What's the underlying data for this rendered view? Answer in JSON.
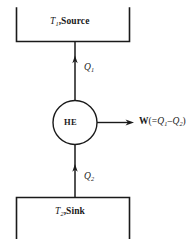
{
  "diagram": {
    "type": "heat-engine-schematic",
    "title": "",
    "colors": {
      "stroke": "#1a1a1a",
      "background": "#ffffff",
      "text": "#1a1a1a"
    },
    "source_reservoir": {
      "name": "source-reservoir",
      "temperature_symbol": "T",
      "temperature_subscript": "1",
      "separator": ",",
      "label": "Source",
      "full_label": "T1,Source",
      "shape": "open-top-rectangle"
    },
    "sink_reservoir": {
      "name": "sink-reservoir",
      "temperature_symbol": "T",
      "temperature_subscript": "2",
      "separator": ",",
      "label": "Sink",
      "full_label": "T2,Sink",
      "shape": "open-bottom-rectangle"
    },
    "engine": {
      "name": "heat-engine",
      "label": "HE",
      "shape": "circle"
    },
    "heat_input": {
      "name": "heat-input-q1",
      "symbol": "Q",
      "subscript": "1",
      "full_label": "Q1",
      "direction": "up",
      "from": "source-reservoir",
      "to": "heat-engine"
    },
    "heat_output": {
      "name": "heat-output-q2",
      "symbol": "Q",
      "subscript": "2",
      "full_label": "Q2",
      "direction": "up",
      "from": "sink-reservoir",
      "to": "heat-engine"
    },
    "work_output": {
      "name": "work-output",
      "symbol": "W",
      "open_paren": "(=",
      "term1_symbol": "Q",
      "term1_subscript": "1",
      "minus": "–",
      "term2_symbol": "Q",
      "term2_subscript": "2",
      "close_paren": ")",
      "full_label": "W(=Q1–Q2)",
      "direction": "right",
      "from": "heat-engine"
    }
  }
}
